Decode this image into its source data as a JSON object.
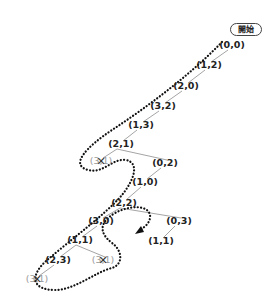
{
  "start_label": "開始",
  "colors": {
    "edge": "#9a9a9a",
    "path": "#111111",
    "pruned_text": "#9a9a9a",
    "text": "#222222"
  },
  "nodes": [
    {
      "id": "n0",
      "label": "(0,0)",
      "x": 232,
      "y": 45
    },
    {
      "id": "n1",
      "label": "(1,2)",
      "x": 209,
      "y": 65
    },
    {
      "id": "n2",
      "label": "(2,0)",
      "x": 186,
      "y": 86
    },
    {
      "id": "n3",
      "label": "(3,2)",
      "x": 163,
      "y": 106
    },
    {
      "id": "n4",
      "label": "(1,3)",
      "x": 141,
      "y": 125
    },
    {
      "id": "n5",
      "label": "(2,1)",
      "x": 121,
      "y": 144
    },
    {
      "id": "n6",
      "label": "(3,1)",
      "x": 101,
      "y": 161,
      "pruned": true
    },
    {
      "id": "n7",
      "label": "(0,2)",
      "x": 165,
      "y": 163
    },
    {
      "id": "n8",
      "label": "(1,0)",
      "x": 145,
      "y": 182
    },
    {
      "id": "n9",
      "label": "(2,2)",
      "x": 124,
      "y": 203
    },
    {
      "id": "n10",
      "label": "(3,0)",
      "x": 101,
      "y": 221
    },
    {
      "id": "n11",
      "label": "(0,3)",
      "x": 179,
      "y": 221
    },
    {
      "id": "n12",
      "label": "(1,1)",
      "x": 80,
      "y": 240
    },
    {
      "id": "n13",
      "label": "(1,1)",
      "x": 161,
      "y": 241
    },
    {
      "id": "n14",
      "label": "(2,3)",
      "x": 58,
      "y": 260
    },
    {
      "id": "n15",
      "label": "(3,1)",
      "x": 103,
      "y": 260,
      "pruned": true
    },
    {
      "id": "n16",
      "label": "(3,1)",
      "x": 37,
      "y": 279,
      "pruned": true
    }
  ],
  "edges": [
    [
      "n0",
      "n1"
    ],
    [
      "n1",
      "n2"
    ],
    [
      "n2",
      "n3"
    ],
    [
      "n3",
      "n4"
    ],
    [
      "n4",
      "n5"
    ],
    [
      "n5",
      "n6"
    ],
    [
      "n5",
      "n7"
    ],
    [
      "n7",
      "n8"
    ],
    [
      "n8",
      "n9"
    ],
    [
      "n9",
      "n10"
    ],
    [
      "n9",
      "n11"
    ],
    [
      "n10",
      "n12"
    ],
    [
      "n11",
      "n13"
    ],
    [
      "n12",
      "n14"
    ],
    [
      "n12",
      "n15"
    ],
    [
      "n14",
      "n16"
    ]
  ]
}
